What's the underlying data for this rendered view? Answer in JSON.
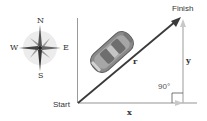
{
  "diagram": {
    "type": "displacement-vector-triangle",
    "compass": {
      "north": "N",
      "south": "S",
      "east": "E",
      "west": "W"
    },
    "points": {
      "start": "Start",
      "finish": "Finish"
    },
    "vectors": {
      "resultant": "r",
      "horizontal": "x",
      "vertical": "y"
    },
    "angle_label": "90°",
    "colors": {
      "resultant": "#3a3a3a",
      "components": "#b8b8b8",
      "axis": "#9a9a9a",
      "compass_bg": "#e6e6e6",
      "text": "#333333"
    }
  }
}
